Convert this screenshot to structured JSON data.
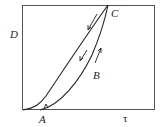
{
  "diagram": {
    "axes": {
      "ylabel": "D",
      "xlabel": "τ"
    },
    "points": {
      "A": "A",
      "B": "B",
      "C": "C"
    },
    "colors": {
      "line": "#222222",
      "frame": "#555555"
    }
  }
}
